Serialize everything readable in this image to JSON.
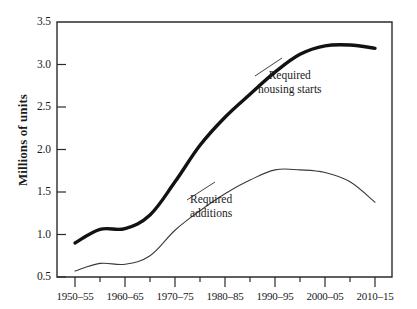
{
  "chart_data": {
    "type": "line",
    "title": "",
    "xlabel": "",
    "ylabel": "Millions of units",
    "ylim": [
      0.5,
      3.5
    ],
    "yticks": [
      "0.5",
      "1.0",
      "1.5",
      "2.0",
      "2.5",
      "3.0",
      "3.5"
    ],
    "ytick_values": [
      0.5,
      1.0,
      1.5,
      2.0,
      2.5,
      3.0,
      3.5
    ],
    "grid": false,
    "legend_position": "inline-annotations",
    "categories": [
      "1950-55",
      "1955-60",
      "1960-65",
      "1965-70",
      "1970-75",
      "1975-80",
      "1980-85",
      "1985-90",
      "1990-95",
      "1995-2000",
      "2000-05",
      "2005-10",
      "2010-15"
    ],
    "xtick_labels": [
      "1950–55",
      "1960–65",
      "1970–75",
      "1980–85",
      "1990–95",
      "2000–05",
      "2010–15"
    ],
    "series": [
      {
        "name": "Required housing starts",
        "style": "thick",
        "values": [
          0.9,
          1.06,
          1.07,
          1.23,
          1.62,
          2.05,
          2.38,
          2.65,
          2.91,
          3.12,
          3.22,
          3.23,
          3.19
        ]
      },
      {
        "name": "Required additions",
        "style": "thin",
        "values": [
          0.57,
          0.66,
          0.65,
          0.75,
          1.05,
          1.28,
          1.48,
          1.64,
          1.76,
          1.76,
          1.73,
          1.62,
          1.38
        ]
      }
    ],
    "annotations": [
      {
        "id": "housing-starts",
        "line1": "Required",
        "line2": "housing starts"
      },
      {
        "id": "additions",
        "line1": "Required",
        "line2": "additions"
      }
    ],
    "colors": {
      "thick_series": "#121212",
      "thin_series": "#3a3a3a",
      "axis": "#2b2b2b",
      "background": "#ffffff"
    }
  }
}
